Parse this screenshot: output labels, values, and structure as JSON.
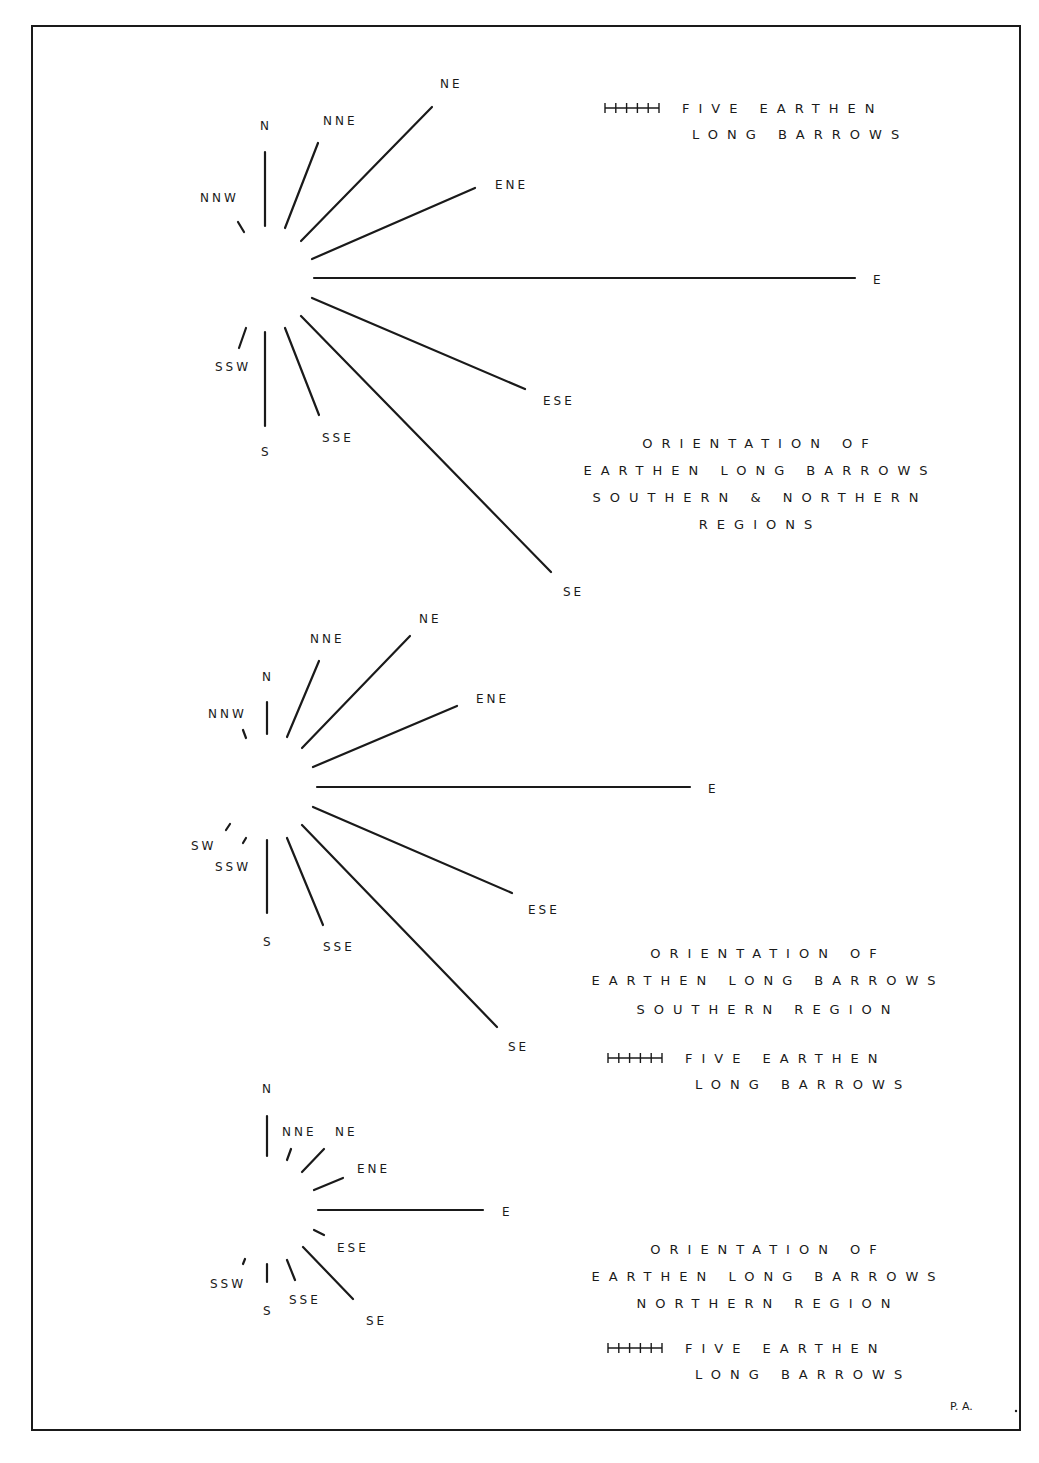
{
  "figure": {
    "signature": "P. A.",
    "colors": {
      "ink": "#1a1a1a",
      "paper": "#ffffff"
    }
  },
  "diagrams": [
    {
      "id": "combined",
      "title_lines": [
        "ORIENTATION OF",
        "EARTHEN LONG BARROWS",
        "SOUTHERN & NORTHERN",
        "REGIONS"
      ],
      "key": {
        "symbol": "scale-bar-five-ticks",
        "line1": "FIVE EARTHEN",
        "line2": "LONG BARROWS"
      },
      "rays": [
        {
          "dir": "NNW",
          "x1": 238,
          "y1": 222,
          "x2": 244,
          "y2": 232,
          "lx": 200,
          "ly": 202,
          "approx_count": 1
        },
        {
          "dir": "N",
          "x1": 265,
          "y1": 152,
          "x2": 265,
          "y2": 226,
          "lx": 260,
          "ly": 130,
          "approx_count": 7
        },
        {
          "dir": "NNE",
          "x1": 285,
          "y1": 228,
          "x2": 318,
          "y2": 143,
          "lx": 323,
          "ly": 125,
          "approx_count": 8
        },
        {
          "dir": "NE",
          "x1": 301,
          "y1": 241,
          "x2": 432,
          "y2": 107,
          "lx": 440,
          "ly": 88,
          "approx_count": 17
        },
        {
          "dir": "ENE",
          "x1": 312,
          "y1": 259,
          "x2": 475,
          "y2": 188,
          "lx": 495,
          "ly": 189,
          "approx_count": 16
        },
        {
          "dir": "E",
          "x1": 314,
          "y1": 278,
          "x2": 855,
          "y2": 278,
          "lx": 873,
          "ly": 284,
          "approx_count": 49
        },
        {
          "dir": "ESE",
          "x1": 312,
          "y1": 298,
          "x2": 525,
          "y2": 389,
          "lx": 543,
          "ly": 405,
          "approx_count": 21
        },
        {
          "dir": "SE",
          "x1": 301,
          "y1": 316,
          "x2": 551,
          "y2": 572,
          "lx": 563,
          "ly": 596,
          "approx_count": 33
        },
        {
          "dir": "SSE",
          "x1": 285,
          "y1": 328,
          "x2": 319,
          "y2": 415,
          "lx": 322,
          "ly": 442,
          "approx_count": 8
        },
        {
          "dir": "S",
          "x1": 265,
          "y1": 332,
          "x2": 265,
          "y2": 426,
          "lx": 261,
          "ly": 456,
          "approx_count": 9
        },
        {
          "dir": "SSW",
          "x1": 246,
          "y1": 328,
          "x2": 239,
          "y2": 348,
          "lx": 215,
          "ly": 371,
          "approx_count": 2
        }
      ],
      "title_pos": {
        "x": 760,
        "y": 448
      },
      "key_pos": {
        "x": 605,
        "y": 112
      }
    },
    {
      "id": "southern",
      "title_lines": [
        "ORIENTATION OF",
        "EARTHEN LONG BARROWS",
        "SOUTHERN REGION"
      ],
      "key": {
        "symbol": "scale-bar-five-ticks",
        "line1": "FIVE EARTHEN",
        "line2": "LONG BARROWS"
      },
      "rays": [
        {
          "dir": "NNW",
          "x1": 243,
          "y1": 730,
          "x2": 246,
          "y2": 738,
          "lx": 208,
          "ly": 718,
          "approx_count": 1
        },
        {
          "dir": "N",
          "x1": 267,
          "y1": 702,
          "x2": 267,
          "y2": 734,
          "lx": 262,
          "ly": 681,
          "approx_count": 3
        },
        {
          "dir": "NNE",
          "x1": 287,
          "y1": 737,
          "x2": 319,
          "y2": 661,
          "lx": 310,
          "ly": 643,
          "approx_count": 7
        },
        {
          "dir": "NE",
          "x1": 302,
          "y1": 748,
          "x2": 410,
          "y2": 636,
          "lx": 419,
          "ly": 623,
          "approx_count": 14
        },
        {
          "dir": "ENE",
          "x1": 313,
          "y1": 767,
          "x2": 457,
          "y2": 706,
          "lx": 476,
          "ly": 703,
          "approx_count": 14
        },
        {
          "dir": "E",
          "x1": 317,
          "y1": 787,
          "x2": 690,
          "y2": 787,
          "lx": 708,
          "ly": 793,
          "approx_count": 34
        },
        {
          "dir": "ESE",
          "x1": 313,
          "y1": 807,
          "x2": 512,
          "y2": 893,
          "lx": 528,
          "ly": 914,
          "approx_count": 20
        },
        {
          "dir": "SE",
          "x1": 302,
          "y1": 825,
          "x2": 497,
          "y2": 1027,
          "lx": 508,
          "ly": 1051,
          "approx_count": 26
        },
        {
          "dir": "SSE",
          "x1": 287,
          "y1": 838,
          "x2": 323,
          "y2": 925,
          "lx": 323,
          "ly": 951,
          "approx_count": 8
        },
        {
          "dir": "S",
          "x1": 267,
          "y1": 840,
          "x2": 267,
          "y2": 913,
          "lx": 263,
          "ly": 946,
          "approx_count": 7
        },
        {
          "dir": "SSW",
          "x1": 246,
          "y1": 838,
          "x2": 243,
          "y2": 843,
          "lx": 215,
          "ly": 871,
          "approx_count": 1
        },
        {
          "dir": "SW",
          "x1": 226,
          "y1": 830,
          "x2": 230,
          "y2": 824,
          "lx": 191,
          "ly": 850,
          "approx_count": 1
        }
      ],
      "title_pos": {
        "x": 768,
        "y": 958
      },
      "key_pos": {
        "x": 608,
        "y": 1062
      }
    },
    {
      "id": "northern",
      "title_lines": [
        "ORIENTATION OF",
        "EARTHEN LONG BARROWS",
        "NORTHERN REGION"
      ],
      "key": {
        "symbol": "scale-bar-five-ticks",
        "line1": "FIVE EARTHEN",
        "line2": "LONG BARROWS"
      },
      "rays": [
        {
          "dir": "N",
          "x1": 267,
          "y1": 1116,
          "x2": 267,
          "y2": 1156,
          "lx": 262,
          "ly": 1093,
          "approx_count": 4
        },
        {
          "dir": "NNE",
          "x1": 287,
          "y1": 1160,
          "x2": 291,
          "y2": 1149,
          "lx": 282,
          "ly": 1136,
          "approx_count": 1
        },
        {
          "dir": "NE",
          "x1": 302,
          "y1": 1172,
          "x2": 324,
          "y2": 1149,
          "lx": 335,
          "ly": 1136,
          "approx_count": 3
        },
        {
          "dir": "ENE",
          "x1": 314,
          "y1": 1190,
          "x2": 343,
          "y2": 1178,
          "lx": 357,
          "ly": 1173,
          "approx_count": 3
        },
        {
          "dir": "E",
          "x1": 318,
          "y1": 1210,
          "x2": 483,
          "y2": 1210,
          "lx": 502,
          "ly": 1216,
          "approx_count": 15
        },
        {
          "dir": "ESE",
          "x1": 314,
          "y1": 1230,
          "x2": 324,
          "y2": 1235,
          "lx": 337,
          "ly": 1252,
          "approx_count": 1
        },
        {
          "dir": "SE",
          "x1": 303,
          "y1": 1247,
          "x2": 353,
          "y2": 1299,
          "lx": 366,
          "ly": 1325,
          "approx_count": 6
        },
        {
          "dir": "SSE",
          "x1": 287,
          "y1": 1260,
          "x2": 295,
          "y2": 1280,
          "lx": 289,
          "ly": 1304,
          "approx_count": 2
        },
        {
          "dir": "S",
          "x1": 267,
          "y1": 1264,
          "x2": 267,
          "y2": 1282,
          "lx": 263,
          "ly": 1315,
          "approx_count": 2
        },
        {
          "dir": "SSW",
          "x1": 245,
          "y1": 1259,
          "x2": 243,
          "y2": 1264,
          "lx": 210,
          "ly": 1288,
          "approx_count": 1
        }
      ],
      "title_pos": {
        "x": 768,
        "y": 1254
      },
      "key_pos": {
        "x": 608,
        "y": 1352
      }
    }
  ]
}
